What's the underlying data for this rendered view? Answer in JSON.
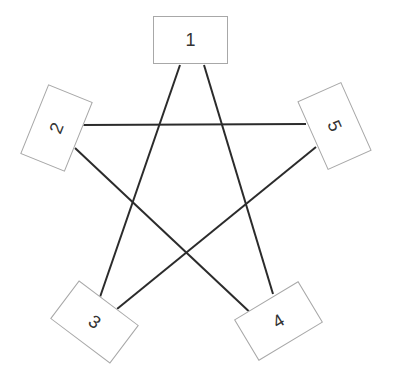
{
  "diagram": {
    "type": "pentagram-graph",
    "colors": {
      "edge": "#2b2b2b",
      "node_border": "#a8a8a8",
      "label": "#333333",
      "background": "#ffffff"
    },
    "nodes": [
      {
        "id": "1",
        "label": "1",
        "cx": 190,
        "cy": 40,
        "rotate": 0
      },
      {
        "id": "2",
        "label": "2",
        "cx": 56,
        "cy": 128,
        "rotate": -68
      },
      {
        "id": "3",
        "label": "3",
        "cx": 94,
        "cy": 322,
        "rotate": 37
      },
      {
        "id": "4",
        "label": "4",
        "cx": 278,
        "cy": 321,
        "rotate": -31
      },
      {
        "id": "5",
        "label": "5",
        "cx": 334,
        "cy": 126,
        "rotate": 66
      }
    ],
    "edges": [
      {
        "from": "1",
        "to": "3",
        "x1": 180,
        "y1": 65,
        "x2": 100,
        "y2": 297
      },
      {
        "from": "1",
        "to": "4",
        "x1": 204,
        "y1": 65,
        "x2": 273,
        "y2": 294
      },
      {
        "from": "2",
        "to": "5",
        "x1": 83,
        "y1": 125,
        "x2": 306,
        "y2": 124
      },
      {
        "from": "2",
        "to": "4",
        "x1": 75,
        "y1": 148,
        "x2": 256,
        "y2": 318
      },
      {
        "from": "5",
        "to": "3",
        "x1": 316,
        "y1": 147,
        "x2": 117,
        "y2": 309
      }
    ]
  }
}
